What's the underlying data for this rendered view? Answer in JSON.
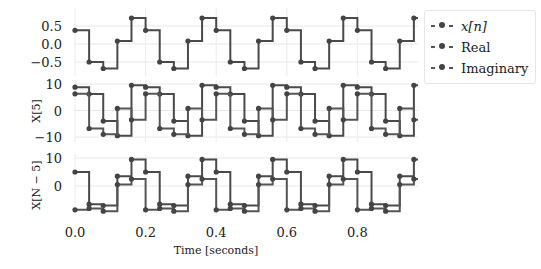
{
  "chart_data": {
    "type": "line",
    "style": "step-with-markers",
    "xlabel": "Time [seconds]",
    "x_ticks": [
      "0.0",
      "0.2",
      "0.4",
      "0.6",
      "0.8"
    ],
    "xlim": [
      0.0,
      0.97
    ],
    "sample_spacing": 0.04,
    "x": [
      0.0,
      0.04,
      0.08,
      0.12,
      0.16,
      0.2,
      0.24,
      0.28,
      0.32,
      0.36,
      0.4,
      0.44,
      0.48,
      0.52,
      0.56,
      0.6,
      0.64,
      0.68,
      0.72,
      0.76,
      0.8,
      0.84,
      0.88,
      0.92,
      0.96
    ],
    "legend": {
      "position": "upper right outside",
      "entries": [
        "x[n]",
        "Real",
        "Imaginary"
      ]
    },
    "grid": true,
    "subplots": [
      {
        "ylabel": "",
        "y_ticks": [
          "0.5",
          "0.0",
          "−0.5"
        ],
        "ylim": [
          -0.8,
          0.85
        ],
        "series": [
          {
            "name": "x[n]",
            "period_values": [
              0.38,
              -0.5,
              -0.68,
              0.08,
              0.72
            ]
          }
        ]
      },
      {
        "ylabel": "X[5]",
        "y_ticks": [
          "10",
          "0",
          "−10"
        ],
        "ylim": [
          -11.5,
          10.5
        ],
        "series": [
          {
            "name": "Real",
            "period_values": [
              8.8,
              6.2,
              -4.0,
              -9.5,
              9.5
            ]
          },
          {
            "name": "Imaginary",
            "period_values": [
              6.3,
              -6.8,
              -9.0,
              0.8,
              -3.5
            ]
          }
        ]
      },
      {
        "ylabel": "X[N − 5]",
        "y_ticks": [
          "10",
          "0"
        ],
        "ylim": [
          -10,
          10.5
        ],
        "series": [
          {
            "name": "Real",
            "period_values": [
              5.0,
              -6.5,
              -7.0,
              3.5,
              9.5
            ]
          },
          {
            "name": "Imaginary",
            "period_values": [
              -8.5,
              -8.0,
              -9.0,
              0.5,
              2.5
            ]
          }
        ]
      }
    ]
  },
  "legend": {
    "items": [
      {
        "label": "x[n]"
      },
      {
        "label": "Real"
      },
      {
        "label": "Imaginary"
      }
    ]
  },
  "axes": {
    "xlabel": "Time [seconds]",
    "ylabel_middle": "X[5]",
    "ylabel_bottom": "X[N − 5]"
  }
}
